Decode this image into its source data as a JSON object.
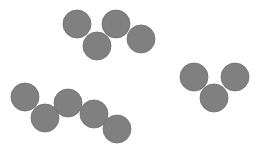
{
  "canvas": {
    "width": 259,
    "height": 154,
    "background": "#ffffff"
  },
  "style": {
    "fill": "#808080",
    "stroke": "#6f6f6f",
    "stroke_width": 0.8,
    "radius": 14
  },
  "groups": [
    {
      "name": "top-group",
      "count": 4,
      "circles": [
        {
          "cx": 77,
          "cy": 24
        },
        {
          "cx": 97,
          "cy": 46
        },
        {
          "cx": 116,
          "cy": 24
        },
        {
          "cx": 141,
          "cy": 39
        }
      ]
    },
    {
      "name": "bottom-left-group",
      "count": 5,
      "circles": [
        {
          "cx": 25,
          "cy": 97
        },
        {
          "cx": 45,
          "cy": 118
        },
        {
          "cx": 68,
          "cy": 103
        },
        {
          "cx": 94,
          "cy": 114
        },
        {
          "cx": 117,
          "cy": 129
        }
      ]
    },
    {
      "name": "right-group",
      "count": 3,
      "circles": [
        {
          "cx": 194,
          "cy": 77
        },
        {
          "cx": 214,
          "cy": 98
        },
        {
          "cx": 235,
          "cy": 77
        }
      ]
    }
  ]
}
